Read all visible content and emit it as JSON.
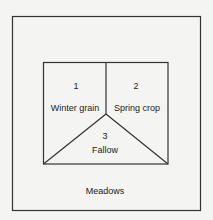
{
  "diagram": {
    "fields": [
      {
        "number": "1",
        "name": "Winter grain"
      },
      {
        "number": "2",
        "name": "Spring crop"
      },
      {
        "number": "3",
        "name": "Fallow"
      }
    ],
    "surround_label": "Meadows"
  }
}
